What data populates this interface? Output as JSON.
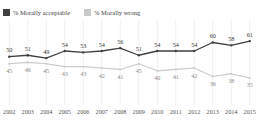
{
  "legend": {
    "position": "top-left",
    "entries": [
      {
        "label": "% Morally acceptable",
        "color": "#404040",
        "swatch_name": "legend-swatch-acceptable"
      },
      {
        "label": "% Morally wrong",
        "color": "#c9c9c9",
        "swatch_name": "legend-swatch-wrong"
      }
    ]
  },
  "chart_data": {
    "type": "line",
    "title": "",
    "subtitle": "",
    "xlabel": "",
    "ylabel": "",
    "grid": "vertical",
    "ylim": [
      30,
      66
    ],
    "categories": [
      "2002",
      "2003",
      "2004",
      "2005",
      "2006",
      "2007",
      "2008",
      "2009",
      "2010",
      "2011",
      "2012",
      "2013",
      "2014",
      "2015"
    ],
    "series": [
      {
        "name": "% Morally acceptable",
        "color": "#404040",
        "values": [
          50,
          51,
          49,
          54,
          53,
          54,
          56,
          51,
          54,
          54,
          54,
          60,
          58,
          61
        ]
      },
      {
        "name": "% Morally wrong",
        "color": "#c9c9c9",
        "values": [
          45,
          46,
          45,
          43,
          43,
          42,
          41,
          45,
          40,
          41,
          42,
          36,
          38,
          35
        ]
      }
    ]
  },
  "x_axis": {
    "tick_labels": [
      "2002",
      "2003",
      "2004",
      "2005",
      "2006",
      "2007",
      "2008",
      "2009",
      "2010",
      "2011",
      "2012",
      "2013",
      "2014",
      "2015"
    ]
  }
}
